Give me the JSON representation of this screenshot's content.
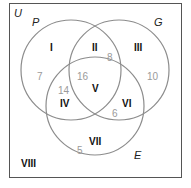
{
  "diagram": {
    "type": "venn",
    "universe_label": "U",
    "sets": [
      {
        "name": "P",
        "label": "P"
      },
      {
        "name": "G",
        "label": "G"
      },
      {
        "name": "E",
        "label": "E"
      }
    ],
    "regions": [
      {
        "id": "I",
        "label": "I",
        "count": "7"
      },
      {
        "id": "II",
        "label": "II",
        "count": "8"
      },
      {
        "id": "III",
        "label": "III",
        "count": "10"
      },
      {
        "id": "IV",
        "label": "IV",
        "count": "14"
      },
      {
        "id": "V",
        "label": "V",
        "count": "16"
      },
      {
        "id": "VI",
        "label": "VI",
        "count": "6"
      },
      {
        "id": "VII",
        "label": "VII",
        "count": "5"
      },
      {
        "id": "VIII",
        "label": "VIII"
      }
    ],
    "colors": {
      "outline": "#8c8c8c",
      "border": "#555555",
      "roman_text": "#111111",
      "count_text": "#9a9a9a"
    }
  }
}
